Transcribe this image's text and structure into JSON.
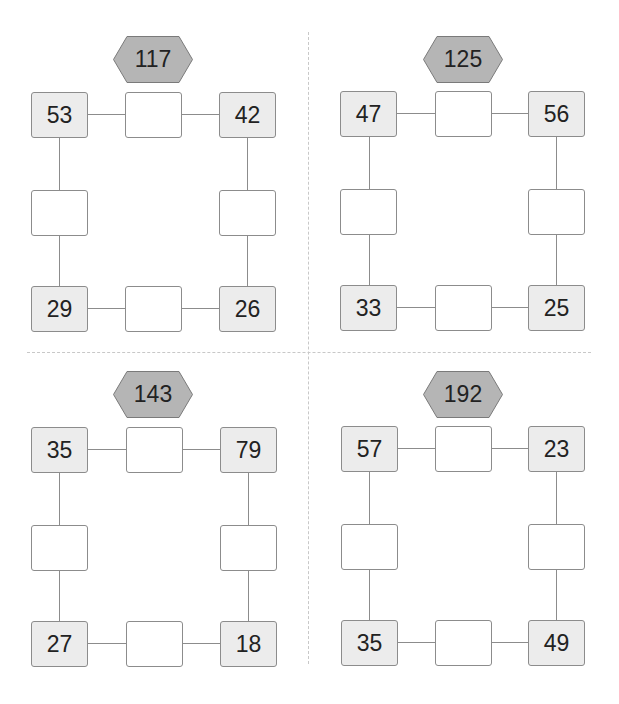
{
  "puzzles": [
    {
      "target_sum": "117",
      "corners": {
        "top_left": "53",
        "top_right": "42",
        "bottom_left": "29",
        "bottom_right": "26"
      },
      "blanks": {
        "top": "",
        "left": "",
        "right": "",
        "bottom": ""
      }
    },
    {
      "target_sum": "125",
      "corners": {
        "top_left": "47",
        "top_right": "56",
        "bottom_left": "33",
        "bottom_right": "25"
      },
      "blanks": {
        "top": "",
        "left": "",
        "right": "",
        "bottom": ""
      }
    },
    {
      "target_sum": "143",
      "corners": {
        "top_left": "35",
        "top_right": "79",
        "bottom_left": "27",
        "bottom_right": "18"
      },
      "blanks": {
        "top": "",
        "left": "",
        "right": "",
        "bottom": ""
      }
    },
    {
      "target_sum": "192",
      "corners": {
        "top_left": "57",
        "top_right": "23",
        "bottom_left": "35",
        "bottom_right": "49"
      },
      "blanks": {
        "top": "",
        "left": "",
        "right": "",
        "bottom": ""
      }
    }
  ],
  "colors": {
    "hexagon_fill": "#b5b5b5",
    "hexagon_border": "#7a7a7a",
    "given_box_fill": "#ececec",
    "blank_box_fill": "#ffffff",
    "line": "#8c8c8c",
    "divider": "#c8c8c8"
  }
}
